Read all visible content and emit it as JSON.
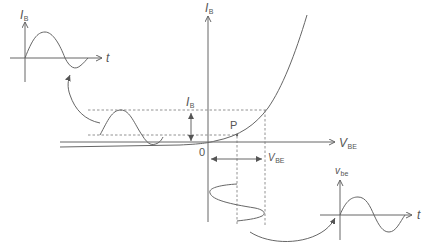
{
  "diagram": {
    "colors": {
      "line": "#666666",
      "dashed": "#777777",
      "text": "#555555"
    },
    "main_axes": {
      "y_label": {
        "main": "I",
        "sub": "B"
      },
      "x_label": {
        "main": "V",
        "sub": "BE"
      },
      "origin_label": "0"
    },
    "operating_point": {
      "label": "P"
    },
    "ib_swing_label": {
      "main": "I",
      "sub": "B"
    },
    "vbe_swing_label": {
      "main": "V",
      "sub": "BE"
    },
    "inset_input": {
      "y_label": {
        "main": "I",
        "sub": "B"
      },
      "x_label": "t"
    },
    "inset_output": {
      "y_label": {
        "main": "v",
        "sub": "be"
      },
      "x_label": "t"
    }
  }
}
